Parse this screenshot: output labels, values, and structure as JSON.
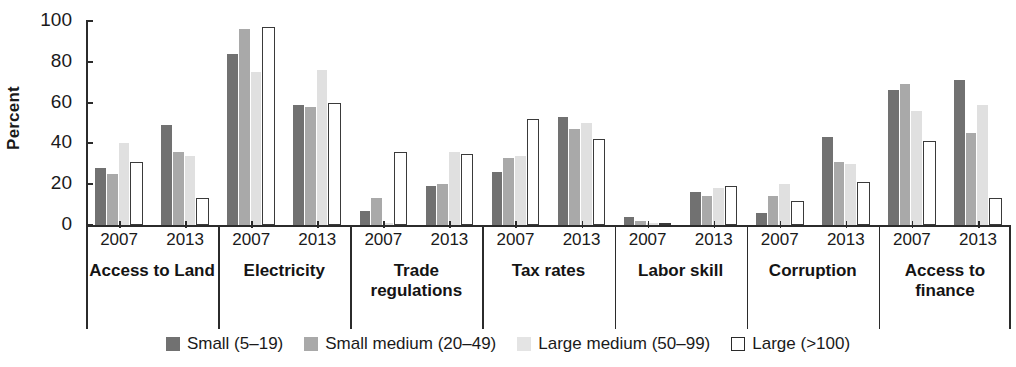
{
  "chart_data": {
    "type": "bar",
    "title": "",
    "xlabel": "",
    "ylabel": "Percent",
    "ylim": [
      0,
      100
    ],
    "yticks": [
      100,
      80,
      60,
      40,
      20,
      0
    ],
    "grid": false,
    "legend_position": "bottom",
    "categories": [
      "Access to Land",
      "Electricity",
      "Trade regulations",
      "Tax rates",
      "Labor skill",
      "Corruption",
      "Access to finance"
    ],
    "subcategories": [
      "2007",
      "2013"
    ],
    "series": [
      {
        "name": "Small (5–19)",
        "color": "#717171",
        "values": {
          "Access to Land": {
            "2007": 28,
            "2013": 49
          },
          "Electricity": {
            "2007": 84,
            "2013": 59
          },
          "Trade regulations": {
            "2007": 7,
            "2013": 19
          },
          "Tax rates": {
            "2007": 26,
            "2013": 53
          },
          "Labor skill": {
            "2007": 4,
            "2013": 16
          },
          "Corruption": {
            "2007": 6,
            "2013": 43
          },
          "Access to finance": {
            "2007": 66,
            "2013": 71
          }
        }
      },
      {
        "name": "Small medium (20–49)",
        "color": "#a9a9a9",
        "values": {
          "Access to Land": {
            "2007": 25,
            "2013": 36
          },
          "Electricity": {
            "2007": 96,
            "2013": 58
          },
          "Trade regulations": {
            "2007": 13,
            "2013": 20
          },
          "Tax rates": {
            "2007": 33,
            "2013": 47
          },
          "Labor skill": {
            "2007": 2,
            "2013": 14
          },
          "Corruption": {
            "2007": 14,
            "2013": 31
          },
          "Access to finance": {
            "2007": 69,
            "2013": 45
          }
        }
      },
      {
        "name": "Large medium (50–99)",
        "color": "#e0e0e0",
        "values": {
          "Access to Land": {
            "2007": 40,
            "2013": 34
          },
          "Electricity": {
            "2007": 75,
            "2013": 76
          },
          "Trade regulations": {
            "2007": 1,
            "2013": 36
          },
          "Tax rates": {
            "2007": 34,
            "2013": 50
          },
          "Labor skill": {
            "2007": 1,
            "2013": 18
          },
          "Corruption": {
            "2007": 20,
            "2013": 30
          },
          "Access to finance": {
            "2007": 56,
            "2013": 59
          }
        }
      },
      {
        "name": "Large (>100)",
        "color": "#ffffff",
        "values": {
          "Access to Land": {
            "2007": 31,
            "2013": 13
          },
          "Electricity": {
            "2007": 97,
            "2013": 60
          },
          "Trade regulations": {
            "2007": 36,
            "2013": 35
          },
          "Tax rates": {
            "2007": 52,
            "2013": 42
          },
          "Labor skill": {
            "2007": 1,
            "2013": 19
          },
          "Corruption": {
            "2007": 12,
            "2013": 21
          },
          "Access to finance": {
            "2007": 41,
            "2013": 13
          }
        }
      }
    ]
  },
  "axis": {
    "ylabel": "Percent",
    "tick_labels": [
      "100",
      "80",
      "60",
      "40",
      "20",
      "0"
    ]
  },
  "legend": {
    "items": [
      {
        "label": "Small (5–19)",
        "style": "s-small"
      },
      {
        "label": "Small medium (20–49)",
        "style": "s-smallmed"
      },
      {
        "label": "Large medium (50–99)",
        "style": "s-largemed"
      },
      {
        "label": "Large (>100)",
        "style": "s-large"
      }
    ]
  },
  "groups": [
    {
      "category": "Access to Land",
      "line1": "Access to Land",
      "line2": "",
      "years": [
        "2007",
        "2013"
      ]
    },
    {
      "category": "Electricity",
      "line1": "Electricity",
      "line2": "",
      "years": [
        "2007",
        "2013"
      ]
    },
    {
      "category": "Trade regulations",
      "line1": "Trade",
      "line2": "regulations",
      "years": [
        "2007",
        "2013"
      ]
    },
    {
      "category": "Tax rates",
      "line1": "Tax rates",
      "line2": "",
      "years": [
        "2007",
        "2013"
      ]
    },
    {
      "category": "Labor skill",
      "line1": "Labor skill",
      "line2": "",
      "years": [
        "2007",
        "2013"
      ]
    },
    {
      "category": "Corruption",
      "line1": "Corruption",
      "line2": "",
      "years": [
        "2007",
        "2013"
      ]
    },
    {
      "category": "Access to finance",
      "line1": "Access to",
      "line2": "finance",
      "years": [
        "2007",
        "2013"
      ]
    }
  ]
}
